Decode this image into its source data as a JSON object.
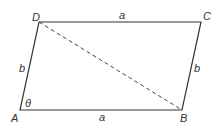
{
  "diagram": {
    "type": "parallelogram",
    "vertices": [
      {
        "name": "A",
        "x": 20,
        "y": 110
      },
      {
        "name": "B",
        "x": 182,
        "y": 110
      },
      {
        "name": "C",
        "x": 201,
        "y": 22
      },
      {
        "name": "D",
        "x": 39,
        "y": 22
      }
    ],
    "vertex_labels": {
      "A": "A",
      "B": "B",
      "C": "C",
      "D": "D"
    },
    "side_labels": {
      "AB": "a",
      "DC": "a",
      "AD": "b",
      "BC": "b"
    },
    "angle_label": "θ",
    "diagonal": {
      "from": "D",
      "to": "B",
      "style": "dashed"
    },
    "line_color": "#333333"
  }
}
